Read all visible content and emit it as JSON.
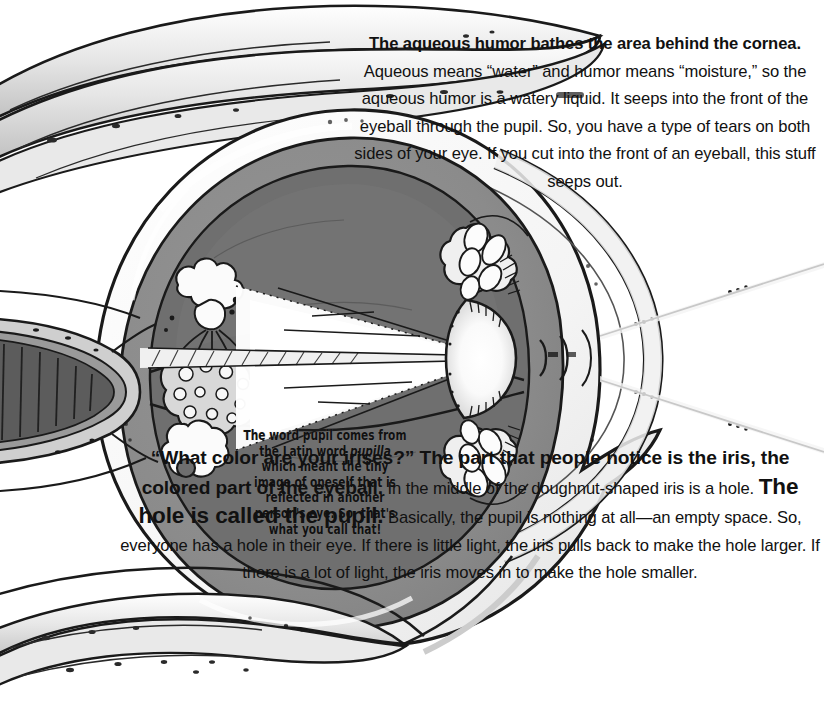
{
  "page": {
    "width": 824,
    "height": 715,
    "background": "#ffffff"
  },
  "figure": {
    "name": "eye-cross-section-illustration",
    "palette": {
      "outline": "#1a1a1a",
      "sclera_white": "#ffffff",
      "vitreous_gray": "#8d8d8d",
      "choroid_dark_gray": "#6e6e6e",
      "retina_mid_gray": "#7d7d7d",
      "muscle_light_gray": "#d8d8d8",
      "highlight": "#f2f2f2",
      "lens_white": "#fbfbfb",
      "optic_nerve_gray": "#595959"
    }
  },
  "top_paragraph": {
    "name": "aqueous-humor-paragraph",
    "bold_lead": "The aqueous humor bathes the area behind the cornea.",
    "body": "Aqueous means “water” and humor means “moisture,” so the aqueous humor is a watery liquid. It seeps into the front of the eyeball through the pupil. So, you have a type of tears on both sides of your eye. If you cut into the front of an eyeball, this stuff seeps out.",
    "lines": [
      "The aqueous humor bathes the area behind",
      "the cornea. Aqueous means “water” and humor",
      "means “moisture,” so the aqueous humor is a",
      "watery liquid. It seeps into the front of the",
      "eyeball through the pupil. So, you have",
      "a type of tears on both sides of your",
      "eye. If you cut into the front of an",
      "eyeball, this stuff seeps out."
    ]
  },
  "pupil_caption": {
    "name": "pupilla-etymology-caption",
    "text_before_italic": "The word pupil comes from the Latin word ",
    "italic_word": "pupilla",
    "text_after_italic": " which meant the tiny image of oneself that is reflected in another person's eye. So, that's what you call that!",
    "lines": [
      "The word pupil comes from",
      "the Latin word pupilla which",
      "meant the tiny image of",
      "oneself that is reflected in",
      "another person's eye. So,",
      "that's what you call that!"
    ]
  },
  "bottom_paragraph": {
    "name": "iris-and-pupil-paragraph",
    "bold_lead": "“What color are your irises?” The part that people notice is the iris, the colored part of the eyeball.",
    "body_1": "In the middle of the doughnut-shaped iris is a hole.",
    "bold_mid": "The hole is called the pupil.",
    "body_2": "Basically, the pupil is nothing at all—an empty space. So, everyone has a hole in their eye. If there is little light, the iris pulls back to make the hole larger. If there is a lot of light, the iris moves in to make the hole smaller.",
    "lines": [
      "“What color",
      "are your irises?” The",
      "part that people notice is",
      "the iris, the colored part of the",
      "eyeball. In the middle of the doughnut-",
      "shaped iris is a hole. The hole is called",
      "the pupil. Basically, the pupil is nothing at",
      "all—an empty space. So, everyone has a hole in their",
      "eye. If there is little light, the iris pulls back to make the hole",
      "larger. If there is a lot of light, the iris moves in to make the hole smaller."
    ]
  }
}
